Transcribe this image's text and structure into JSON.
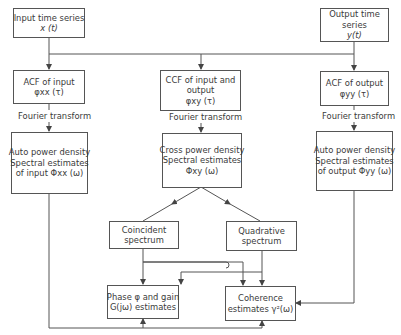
{
  "diagram": {
    "type": "block-flowchart",
    "boxes": {
      "input": {
        "line1": "Input time series",
        "line2": "x (t)"
      },
      "output": {
        "line1": "Output time",
        "line2": "series",
        "line3": "y(t)"
      },
      "acf_input": {
        "line1": "ACF of input",
        "line2": "φxx (τ)"
      },
      "ccf": {
        "line1": "CCF of input and",
        "line2": "output",
        "line3": "φxy  (τ)"
      },
      "acf_output": {
        "line1": "ACF of output",
        "line2": "φyy (τ)"
      },
      "apd_input": {
        "line1": "Auto power density",
        "line2": "Spectral estimates",
        "line3": "of input Φxx (ω)"
      },
      "cpd": {
        "line1": "Cross power density",
        "line2": "Spectral estimates",
        "line3": "Φxy  (ω)"
      },
      "apd_output": {
        "line1": "Auto power density",
        "line2": "Spectral estimates",
        "line3": "of output Φyy (ω)"
      },
      "coincident": {
        "line1": "Coincident",
        "line2": "spectrum"
      },
      "quadrative": {
        "line1": "Quadrative",
        "line2": "spectrum"
      },
      "phase_gain": {
        "line1": "Phase φ and gain",
        "line2": "G(jω)  estimates"
      },
      "coherence": {
        "line1": "Coherence",
        "line2": "estimates γ²(ω)"
      }
    },
    "edge_labels": {
      "ft_left": "Fourier transform",
      "ft_middle": "Fourier transform",
      "ft_right": "Fourier transform"
    },
    "colors": {
      "line": "#555555",
      "text": "#3a3a3a",
      "background": "#ffffff"
    }
  }
}
